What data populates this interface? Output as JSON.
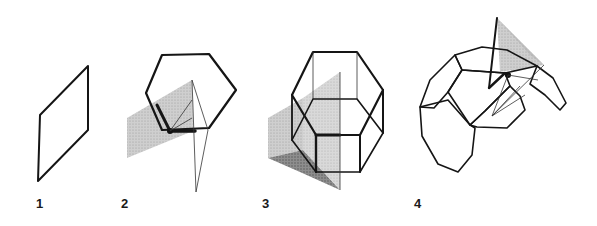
{
  "figure": {
    "panels": [
      {
        "id": "1",
        "label": "1",
        "description": "single shaded rhombic plane"
      },
      {
        "id": "2",
        "label": "2",
        "description": "hexagon with intersecting shaded plane and fan of thin lines from a vertex"
      },
      {
        "id": "3",
        "label": "3",
        "description": "hexagonal prism wireframe with intersecting shaded planes"
      },
      {
        "id": "4",
        "label": "4",
        "description": "partial polyhedral shell of hexagons/octagons with shaded triangular plane and fan of lines"
      }
    ],
    "colors": {
      "stroke": "#151515",
      "shade_light": "#c8c8c8",
      "shade_dark": "#8a8a8a",
      "background": "#ffffff"
    }
  }
}
